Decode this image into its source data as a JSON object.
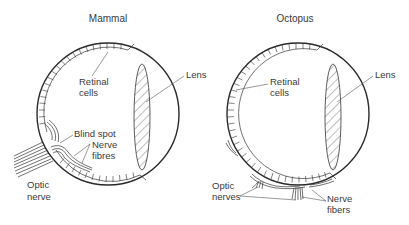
{
  "figure": {
    "panels": [
      {
        "id": "mammal",
        "title": "Mammal",
        "labels": {
          "retinal_line1": "Retinal",
          "retinal_line2": "cells",
          "lens": "Lens",
          "blind_spot": "Blind spot",
          "nerve_line1": "Nerve",
          "nerve_line2": "fibres",
          "optic_line1": "Optic",
          "optic_line2": "nerve"
        }
      },
      {
        "id": "octopus",
        "title": "Octopus",
        "labels": {
          "retinal_line1": "Retinal",
          "retinal_line2": "cells",
          "lens": "Lens",
          "optic_line1": "Optic",
          "optic_line2": "nerves",
          "nerve_line1": "Nerve",
          "nerve_line2": "fibers"
        }
      }
    ],
    "colors": {
      "line": "#2a2a2a",
      "text": "#3a3a3a",
      "background": "#ffffff"
    }
  }
}
